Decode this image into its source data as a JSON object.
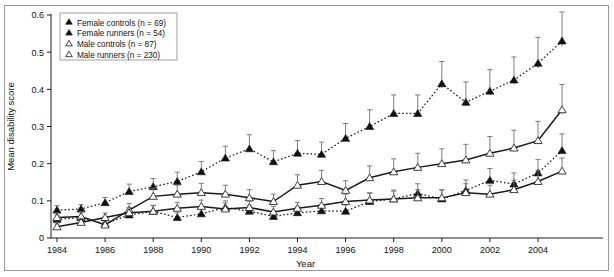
{
  "chart_data": {
    "type": "line",
    "title": "",
    "xlabel": "Year",
    "ylabel": "Mean disability score",
    "xlim": [
      1983.4,
      2005.6
    ],
    "ylim": [
      0,
      0.6
    ],
    "yticks": [
      0,
      0.1,
      0.2,
      0.3,
      0.4,
      0.5,
      0.6
    ],
    "ytick_labels": [
      "0",
      "0.1",
      "0.2",
      "0.3",
      "0.4",
      "0.5",
      "0.6"
    ],
    "xticks": [
      1984,
      1986,
      1988,
      1990,
      1992,
      1994,
      1996,
      1998,
      2000,
      2002,
      2004
    ],
    "xtick_labels": [
      "1984",
      "1986",
      "1988",
      "1990",
      "1992",
      "1994",
      "1996",
      "1998",
      "2000",
      "2002",
      "2004"
    ],
    "grid": false,
    "legend_position": "top-left",
    "x": [
      1984,
      1985,
      1986,
      1987,
      1988,
      1989,
      1990,
      1991,
      1992,
      1993,
      1994,
      1995,
      1996,
      1997,
      1998,
      1999,
      2000,
      2001,
      2002,
      2003,
      2004,
      2005
    ],
    "series": [
      {
        "name": "Female controls (n = 69)",
        "marker": "filled-triangle",
        "linestyle": "dotted",
        "color": "#111111",
        "values": [
          0.075,
          0.078,
          0.095,
          0.125,
          0.138,
          0.152,
          0.178,
          0.215,
          0.24,
          0.205,
          0.228,
          0.225,
          0.268,
          0.3,
          0.335,
          0.335,
          0.415,
          0.365,
          0.395,
          0.425,
          0.47,
          0.53
        ],
        "errors": [
          0.012,
          0.012,
          0.014,
          0.02,
          0.022,
          0.025,
          0.028,
          0.032,
          0.038,
          0.03,
          0.034,
          0.033,
          0.04,
          0.045,
          0.05,
          0.05,
          0.06,
          0.055,
          0.058,
          0.062,
          0.07,
          0.078
        ]
      },
      {
        "name": "Female runners (n = 54)",
        "marker": "filled-triangle",
        "linestyle": "dotted",
        "color": "#111111",
        "values": [
          0.05,
          0.055,
          0.038,
          0.062,
          0.072,
          0.055,
          0.065,
          0.082,
          0.072,
          0.058,
          0.068,
          0.073,
          0.072,
          0.098,
          0.105,
          0.12,
          0.105,
          0.128,
          0.155,
          0.145,
          0.175,
          0.235
        ],
        "errors": [
          0.012,
          0.013,
          0.01,
          0.015,
          0.016,
          0.013,
          0.015,
          0.018,
          0.016,
          0.014,
          0.016,
          0.017,
          0.017,
          0.022,
          0.024,
          0.026,
          0.024,
          0.028,
          0.032,
          0.03,
          0.036,
          0.045
        ]
      },
      {
        "name": "Male controls (n = 87)",
        "marker": "open-triangle",
        "linestyle": "solid",
        "color": "#111111",
        "values": [
          0.055,
          0.058,
          0.035,
          0.075,
          0.112,
          0.118,
          0.122,
          0.118,
          0.108,
          0.098,
          0.142,
          0.152,
          0.128,
          0.162,
          0.178,
          0.19,
          0.2,
          0.21,
          0.228,
          0.242,
          0.262,
          0.345
        ],
        "errors": [
          0.012,
          0.013,
          0.01,
          0.018,
          0.022,
          0.024,
          0.025,
          0.024,
          0.022,
          0.02,
          0.028,
          0.03,
          0.026,
          0.032,
          0.035,
          0.038,
          0.04,
          0.042,
          0.045,
          0.048,
          0.052,
          0.068
        ]
      },
      {
        "name": "Male runners (n = 230)",
        "marker": "open-triangle",
        "linestyle": "solid",
        "color": "#111111",
        "values": [
          0.03,
          0.042,
          0.055,
          0.068,
          0.072,
          0.08,
          0.085,
          0.078,
          0.082,
          0.07,
          0.08,
          0.088,
          0.098,
          0.102,
          0.105,
          0.108,
          0.108,
          0.122,
          0.118,
          0.13,
          0.152,
          0.18
        ],
        "errors": [
          0.008,
          0.01,
          0.012,
          0.014,
          0.015,
          0.016,
          0.017,
          0.016,
          0.017,
          0.015,
          0.016,
          0.018,
          0.02,
          0.02,
          0.021,
          0.022,
          0.022,
          0.024,
          0.024,
          0.026,
          0.03,
          0.035
        ]
      }
    ],
    "legend": [
      {
        "label": "Female controls (n = 69)",
        "marker": "filled-triangle"
      },
      {
        "label": "Female runners (n = 54)",
        "marker": "filled-triangle"
      },
      {
        "label": "Male controls (n = 87)",
        "marker": "open-triangle"
      },
      {
        "label": "Male runners (n = 230)",
        "marker": "open-triangle"
      }
    ]
  }
}
